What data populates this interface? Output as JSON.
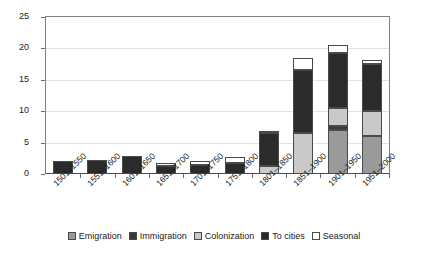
{
  "chart_data": {
    "type": "bar",
    "stacked": true,
    "title": "",
    "subtitle": "",
    "xlabel": "",
    "ylabel": "",
    "ylim": [
      0,
      25
    ],
    "yticks": [
      0,
      5,
      10,
      15,
      20,
      25
    ],
    "grid": true,
    "legend_position": "bottom",
    "categories": [
      "1501–1550",
      "1551–1600",
      "1601–1650",
      "1651–1700",
      "1701–1750",
      "1751–1800",
      "1801–1850",
      "1851–1900",
      "1901–1950",
      "1951–2000"
    ],
    "series": [
      {
        "name": "Emigration",
        "color": "#9a9a9a",
        "values": [
          0,
          0,
          0,
          0,
          0,
          0,
          0,
          0,
          7.0,
          6.0
        ]
      },
      {
        "name": "Immigration",
        "color": "#3a3a3a",
        "values": [
          0,
          0,
          0,
          0,
          0,
          0,
          0,
          0,
          0.7,
          0
        ]
      },
      {
        "name": "Colonization",
        "color": "#c9c9c9",
        "values": [
          0,
          0,
          0,
          0,
          0,
          0,
          1.2,
          6.5,
          2.8,
          4.0
        ]
      },
      {
        "name": "To cities",
        "color": "#2b2b2b",
        "values": [
          2.0,
          2.2,
          2.9,
          1.3,
          1.5,
          1.8,
          5.3,
          10.0,
          8.8,
          7.5
        ]
      },
      {
        "name": "Seasonal",
        "color": "#ffffff",
        "values": [
          0,
          0,
          0,
          0.4,
          0.5,
          0.9,
          0.4,
          2.0,
          1.3,
          0.6
        ]
      }
    ],
    "totals": [
      2.0,
      2.2,
      2.9,
      1.7,
      2.0,
      2.7,
      6.9,
      18.5,
      20.0,
      18.1
    ]
  },
  "legend": {
    "items": [
      {
        "label": "Emigration"
      },
      {
        "label": "Immigration"
      },
      {
        "label": "Colonization"
      },
      {
        "label": "To cities"
      },
      {
        "label": "Seasonal"
      }
    ]
  }
}
